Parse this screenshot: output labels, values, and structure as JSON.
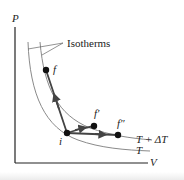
{
  "diagram": {
    "axes": {
      "y_label": "P",
      "x_label": "V"
    },
    "annotation": "Isotherms",
    "isotherm_labels": {
      "upper": "T + ΔT",
      "lower": "T"
    },
    "points": {
      "initial": "i",
      "final_1": "f",
      "final_2": "f′",
      "final_3": "f″"
    },
    "colors": {
      "axis": "#222222",
      "isotherm": "#8a8a8a",
      "path": "#444444",
      "point": "#111111"
    }
  }
}
